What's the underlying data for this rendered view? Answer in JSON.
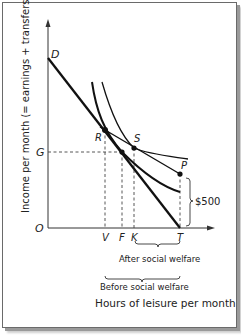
{
  "diagram": {
    "y_axis_label": "Income per month (= earnings + transfers)",
    "x_axis_label": "Hours of leisure per month",
    "points": {
      "D": "D",
      "G": "G",
      "O": "O",
      "R": "R",
      "S": "S",
      "P": "P",
      "V": "V",
      "F": "F",
      "K": "K",
      "T": "T"
    },
    "transfer_amount": "$500",
    "brace_after": "After social welfare",
    "brace_before": "Before social welfare"
  }
}
